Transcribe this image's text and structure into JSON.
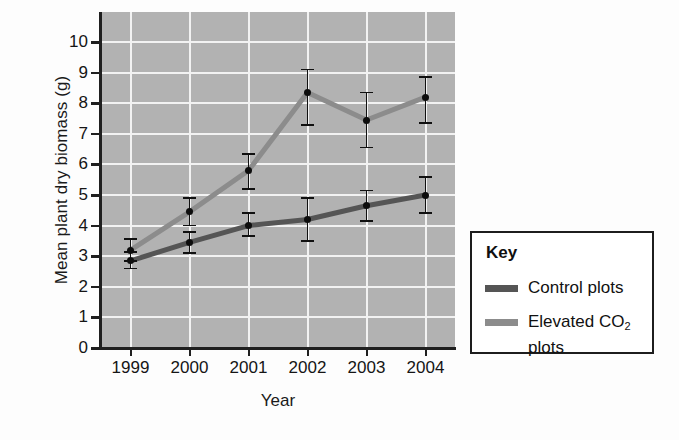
{
  "chart_data": {
    "type": "line",
    "title": "",
    "xlabel": "Year",
    "ylabel": "Mean plant dry biomass (g)",
    "categories": [
      "1999",
      "2000",
      "2001",
      "2002",
      "2003",
      "2004"
    ],
    "x_tick_labels": [
      "1999",
      "2000",
      "2001",
      "2002",
      "2003",
      "2004"
    ],
    "y_tick_labels": [
      "0",
      "1",
      "2",
      "3",
      "4",
      "5",
      "6",
      "7",
      "8",
      "9",
      "10"
    ],
    "ylim": [
      0,
      11
    ],
    "y_ticks": [
      0,
      1,
      2,
      3,
      4,
      5,
      6,
      7,
      8,
      9,
      10
    ],
    "grid": "white gridlines on gray panel",
    "legend_position": "right, outside plot, boxed",
    "series": [
      {
        "name": "Control plots",
        "color": "#555555",
        "values": [
          2.85,
          3.45,
          4.0,
          4.2,
          4.65,
          5.0
        ],
        "error_low": [
          2.6,
          3.1,
          3.65,
          3.5,
          4.15,
          4.4
        ],
        "error_high": [
          3.15,
          3.8,
          4.4,
          4.9,
          5.15,
          5.6
        ]
      },
      {
        "name": "Elevated CO2 plots",
        "color": "#8c8c8c",
        "values": [
          3.2,
          4.45,
          5.8,
          8.35,
          7.45,
          8.2
        ],
        "error_low": [
          2.85,
          4.0,
          5.2,
          7.3,
          6.55,
          7.35
        ],
        "error_high": [
          3.55,
          4.9,
          6.35,
          9.1,
          8.35,
          8.85
        ]
      }
    ],
    "colors": {
      "panel_background": "#b2b2b2",
      "gridline": "#f2f2f2",
      "axis": "#1f1f1f",
      "marker": "#0d0d0d",
      "control_line": "#555555",
      "elevated_line": "#8c8c8c"
    }
  },
  "legend": {
    "title": "Key",
    "entries": [
      {
        "label": "Control plots",
        "label_prefix": "Control plots",
        "label_sub": "",
        "label_suffix": "",
        "color": "#555555"
      },
      {
        "label": "Elevated CO2 plots",
        "label_prefix": "Elevated CO",
        "label_sub": "2",
        "label_suffix": "plots",
        "color": "#8c8c8c"
      }
    ]
  }
}
